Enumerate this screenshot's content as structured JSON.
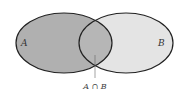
{
  "diagram": {
    "type": "venn",
    "sets": [
      {
        "name": "A",
        "label": "A",
        "fill": "#b0b0b0"
      },
      {
        "name": "B",
        "label": "B",
        "fill": "#e4e4e4"
      }
    ],
    "intersection": {
      "label": "A ∩ B",
      "fill": "#b0b0b0"
    },
    "stroke": "#222222"
  }
}
